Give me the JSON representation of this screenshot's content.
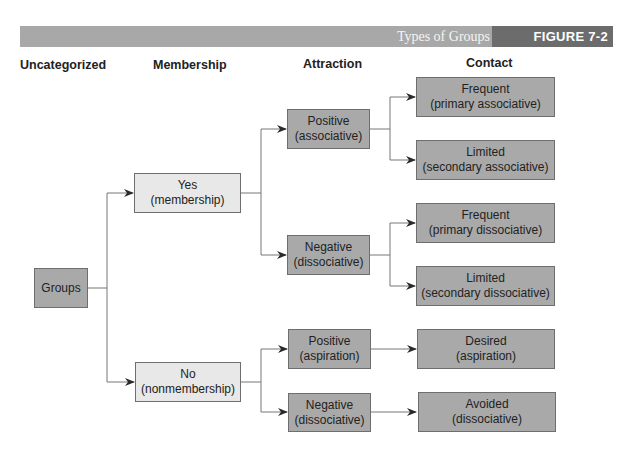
{
  "header": {
    "title": "Types of Groups",
    "figure_label": "FIGURE 7-2"
  },
  "columns": {
    "uncategorized": "Uncategorized",
    "membership": "Membership",
    "attraction": "Attraction",
    "contact": "Contact"
  },
  "nodes": {
    "groups": {
      "line1": "Groups"
    },
    "yes": {
      "line1": "Yes",
      "line2": "(membership)"
    },
    "no": {
      "line1": "No",
      "line2": "(nonmembership)"
    },
    "yes_positive": {
      "line1": "Positive",
      "line2": "(associative)"
    },
    "yes_negative": {
      "line1": "Negative",
      "line2": "(dissociative)"
    },
    "no_positive": {
      "line1": "Positive",
      "line2": "(aspiration)"
    },
    "no_negative": {
      "line1": "Negative",
      "line2": "(dissociative)"
    },
    "primary_associative": {
      "line1": "Frequent",
      "line2": "(primary associative)"
    },
    "secondary_associative": {
      "line1": "Limited",
      "line2": "(secondary associative)"
    },
    "primary_dissociative": {
      "line1": "Frequent",
      "line2": "(primary dissociative)"
    },
    "secondary_dissociative": {
      "line1": "Limited",
      "line2": "(secondary dissociative)"
    },
    "desired": {
      "line1": "Desired",
      "line2": "(aspiration)"
    },
    "avoided": {
      "line1": "Avoided",
      "line2": "(dissociative)"
    }
  },
  "colors": {
    "dark_box": "#a9a9a9",
    "light_box": "#e8e8e8",
    "banner": "#a8a8a8",
    "banner_dark": "#6c6c6c",
    "line": "#777777"
  }
}
